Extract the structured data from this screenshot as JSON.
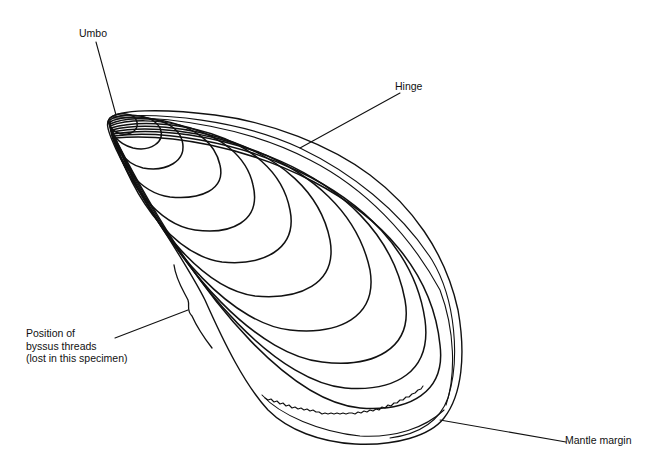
{
  "diagram": {
    "colors": {
      "background": "#ffffff",
      "ink": "#111111"
    },
    "labels": {
      "umbo": "Umbo",
      "hinge": "Hinge",
      "byssus": {
        "line1": "Position of",
        "line2": "byssus threads",
        "line3": "(lost in this specimen)"
      },
      "mantle_margin": "Mantle margin"
    }
  }
}
